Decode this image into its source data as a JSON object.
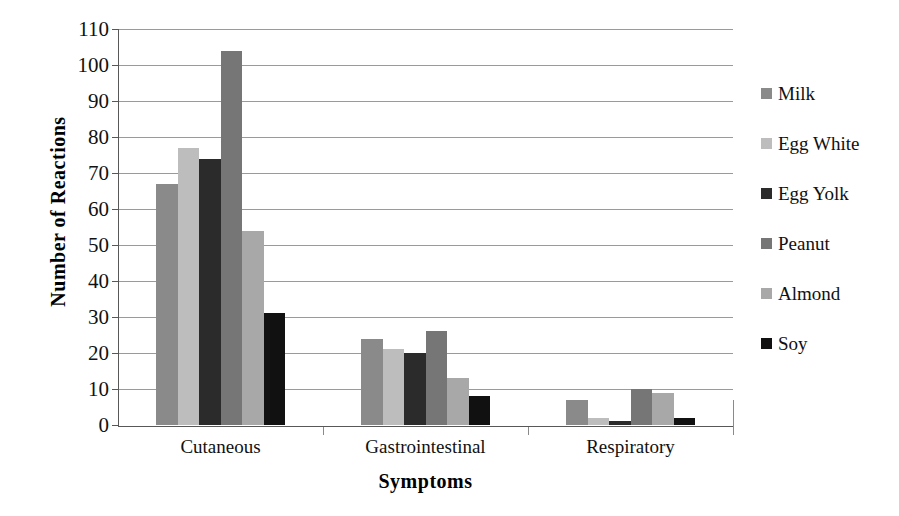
{
  "chart_data": {
    "type": "bar",
    "title": "",
    "xlabel": "Symptoms",
    "ylabel": "Number of Reactions",
    "categories": [
      "Cutaneous",
      "Gastrointestinal",
      "Respiratory"
    ],
    "ylim": [
      0,
      110
    ],
    "yticks": [
      0,
      10,
      20,
      30,
      40,
      50,
      60,
      70,
      80,
      90,
      100,
      110
    ],
    "ytick_labels": [
      "0",
      "10",
      "20",
      "30",
      "40",
      "50",
      "60",
      "70",
      "80",
      "90",
      "100",
      "110"
    ],
    "grid": true,
    "legend_position": "right",
    "series": [
      {
        "name": "Milk",
        "color": "#8a8a8a",
        "values": [
          67,
          24,
          7
        ]
      },
      {
        "name": "Egg White",
        "color": "#bdbdbd",
        "values": [
          77,
          21,
          2
        ]
      },
      {
        "name": "Egg Yolk",
        "color": "#2b2b2b",
        "values": [
          74,
          20,
          1
        ]
      },
      {
        "name": "Peanut",
        "color": "#767676",
        "values": [
          104,
          26,
          10
        ]
      },
      {
        "name": "Almond",
        "color": "#a8a8a8",
        "values": [
          54,
          13,
          9
        ]
      },
      {
        "name": "Soy",
        "color": "#111111",
        "values": [
          31,
          8,
          2
        ]
      }
    ]
  }
}
